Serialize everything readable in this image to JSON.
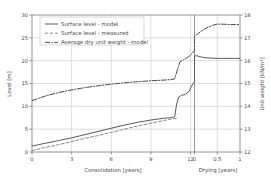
{
  "chart_data": {
    "type": "line",
    "title": "",
    "xlabel": "Consolidation [years]",
    "xlabel2": "Drying [years]",
    "ylabel": "Level [m]",
    "ylabel2": "Unit weight [kN/m³]",
    "ylim": [
      0,
      30
    ],
    "ylim2": [
      12,
      18
    ],
    "yticks": [
      "0",
      "5",
      "10",
      "15",
      "20",
      "25",
      "30"
    ],
    "ytick_values": [
      0,
      5,
      10,
      15,
      20,
      25,
      30
    ],
    "yticks2": [
      "12",
      "13",
      "14",
      "15",
      "16",
      "17",
      "18"
    ],
    "ytick_values2": [
      12,
      13,
      14,
      15,
      16,
      17,
      18
    ],
    "xticks_consolidation": [
      "0",
      "3",
      "6",
      "9",
      "12"
    ],
    "xtick_values_consolidation": [
      0,
      3,
      6,
      9,
      12
    ],
    "xticks_drying": [
      "0",
      "0.5",
      "1"
    ],
    "xtick_values_drying": [
      0,
      0.5,
      1
    ],
    "xlim_consolidation": [
      0,
      12.3
    ],
    "xlim_drying": [
      0,
      1
    ],
    "grid": true,
    "legend_position": "upper left",
    "legend": [
      "Surface level - model",
      "Surface level - measured",
      "Average dry unit weight - model"
    ],
    "series": [
      {
        "name": "Surface level - model",
        "axis": "left",
        "style": "solid",
        "color": "#595959",
        "phase_consolidation": {
          "x": [
            0,
            1,
            2,
            3,
            4,
            5,
            6,
            7,
            8,
            9,
            10,
            10.5,
            10.8,
            10.95,
            11.1,
            11.3,
            11.6,
            11.9,
            12.1,
            12.3
          ],
          "y": [
            1.3,
            1.9,
            2.5,
            3.1,
            3.8,
            4.5,
            5.2,
            5.9,
            6.5,
            7.0,
            7.4,
            7.5,
            7.7,
            10.5,
            12.0,
            12.4,
            12.6,
            13.3,
            14.6,
            15.4
          ]
        },
        "phase_drying": {
          "x": [
            0,
            0.05,
            0.1,
            0.2,
            0.3,
            0.4,
            0.5,
            0.6,
            0.7,
            0.8,
            0.9,
            1.0
          ],
          "y": [
            21.0,
            21.1,
            20.9,
            20.7,
            20.6,
            20.55,
            20.5,
            20.5,
            20.5,
            20.5,
            20.5,
            20.5
          ]
        },
        "note_bridge": "solid model curve rises steeply from 15.4 m at end of consolidation to 21.0 m at start of drying"
      },
      {
        "name": "Surface level - measured",
        "axis": "left",
        "style": "dashed",
        "color": "#8c8c8c",
        "phase_consolidation": {
          "x": [
            0,
            1,
            2,
            3,
            4,
            5,
            6,
            7,
            8,
            9,
            10,
            10.5,
            11.0
          ],
          "y": [
            0.3,
            1.0,
            1.6,
            2.3,
            3.0,
            3.6,
            4.3,
            5.0,
            5.7,
            6.3,
            6.9,
            7.2,
            7.4
          ]
        },
        "phase_drying": {
          "x": [],
          "y": []
        }
      },
      {
        "name": "Average dry unit weight - model",
        "axis": "right",
        "style": "dashdot",
        "color": "#4a4a4a",
        "phase_consolidation": {
          "x": [
            0,
            0.5,
            1,
            2,
            3,
            4,
            5,
            6,
            7,
            8,
            9,
            10,
            10.5,
            10.8,
            11.0,
            11.2,
            11.5,
            11.8,
            12.1,
            12.3
          ],
          "y": [
            14.25,
            14.35,
            14.45,
            14.6,
            14.72,
            14.82,
            14.9,
            14.97,
            15.03,
            15.08,
            15.12,
            15.15,
            15.17,
            15.2,
            15.6,
            15.95,
            16.05,
            16.15,
            16.3,
            16.45
          ]
        },
        "phase_drying": {
          "x": [
            0,
            0.1,
            0.2,
            0.3,
            0.4,
            0.5,
            0.6,
            0.7,
            0.8,
            0.9,
            1.0
          ],
          "y": [
            17.05,
            17.22,
            17.36,
            17.47,
            17.55,
            17.6,
            17.6,
            17.59,
            17.58,
            17.58,
            17.58
          ]
        },
        "note_bridge": "dash-dot curve continues from 16.45 kN/m³ at end of consolidation to 17.05 kN/m³ at start of drying"
      }
    ]
  },
  "colors": {
    "grid": "#c8c8c8",
    "axis": "#7a7a7a",
    "text": "#4a4a4a",
    "series_model": "#595959",
    "series_measured": "#8c8c8c",
    "series_unitweight": "#4a4a4a",
    "background": "#ffffff"
  }
}
